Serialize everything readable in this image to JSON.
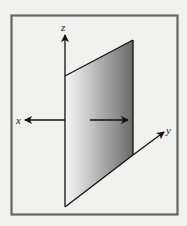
{
  "diagram": {
    "axes": [
      {
        "name": "z",
        "label": "z"
      },
      {
        "name": "x",
        "label": "x"
      },
      {
        "name": "y",
        "label": "y"
      }
    ],
    "colors": {
      "background": "#f1f1ef",
      "frame": "#666666",
      "plane_light": "#f4f4f4",
      "plane_dark": "#6e6e6e",
      "ink": "#111111"
    }
  }
}
